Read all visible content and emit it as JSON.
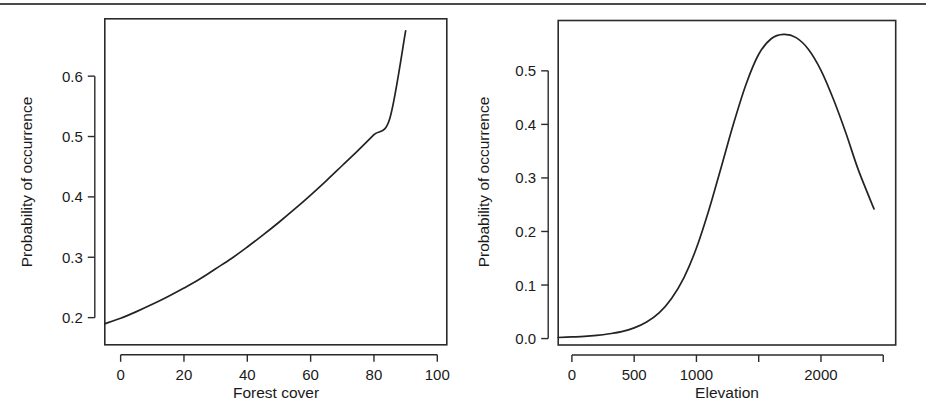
{
  "figure": {
    "background_color": "#ffffff",
    "line_color": "#232323",
    "axis_color": "#2b2b2b",
    "top_rule_color": "#4a4a4a"
  },
  "chart_data": [
    {
      "type": "line",
      "panel": "left",
      "title": "",
      "xlabel": "Forest cover",
      "ylabel": "Probability of occurrence",
      "xlim": [
        -5,
        103
      ],
      "ylim": [
        0.155,
        0.695
      ],
      "grid": false,
      "legend": null,
      "xticks": [
        0,
        20,
        40,
        60,
        80,
        100
      ],
      "xtick_labels": [
        "0",
        "20",
        "40",
        "60",
        "80",
        "100"
      ],
      "yticks": [
        0.2,
        0.3,
        0.4,
        0.5,
        0.6
      ],
      "ytick_labels": [
        "0.2",
        "0.3",
        "0.4",
        "0.5",
        "0.6"
      ],
      "series": [
        {
          "name": "Probability of occurrence vs forest cover",
          "x": [
            -5,
            0,
            5,
            10,
            15,
            20,
            25,
            30,
            35,
            40,
            45,
            50,
            55,
            60,
            65,
            70,
            75,
            80,
            85,
            90
          ],
          "y": [
            0.19,
            0.199,
            0.21,
            0.222,
            0.235,
            0.249,
            0.264,
            0.281,
            0.298,
            0.317,
            0.337,
            0.358,
            0.38,
            0.403,
            0.427,
            0.452,
            0.477,
            0.503,
            0.53,
            0.675
          ]
        }
      ]
    },
    {
      "type": "line",
      "panel": "right",
      "title": "",
      "xlabel": "Elevation",
      "ylabel": "Probability of occurrence",
      "xlim": [
        -110,
        2600
      ],
      "ylim": [
        -0.012,
        0.594
      ],
      "grid": false,
      "legend": null,
      "xticks": [
        0,
        500,
        1000,
        1500,
        2000,
        2500
      ],
      "xtick_labels": [
        "0",
        "500",
        "1000",
        "",
        "2000",
        ""
      ],
      "yticks": [
        0.0,
        0.1,
        0.2,
        0.3,
        0.4,
        0.5
      ],
      "ytick_labels": [
        "0.0",
        "0.1",
        "0.2",
        "0.3",
        "0.4",
        "0.5"
      ],
      "series": [
        {
          "name": "Probability of occurrence vs elevation",
          "x": [
            -110,
            0,
            100,
            200,
            300,
            400,
            500,
            600,
            700,
            800,
            900,
            1000,
            1100,
            1200,
            1300,
            1400,
            1500,
            1600,
            1700,
            1800,
            1900,
            2000,
            2100,
            2200,
            2300,
            2426
          ],
          "y": [
            0.002,
            0.003,
            0.004,
            0.006,
            0.009,
            0.013,
            0.02,
            0.031,
            0.048,
            0.075,
            0.114,
            0.169,
            0.24,
            0.321,
            0.403,
            0.476,
            0.531,
            0.56,
            0.568,
            0.562,
            0.54,
            0.501,
            0.447,
            0.384,
            0.315,
            0.242
          ]
        }
      ]
    }
  ]
}
